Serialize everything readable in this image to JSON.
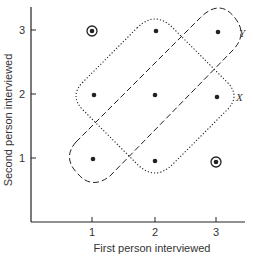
{
  "diagram": {
    "xlabel": "First person interviewed",
    "ylabel": "Second person interviewed",
    "x_ticks": [
      "1",
      "2",
      "3"
    ],
    "y_ticks": [
      "1",
      "2",
      "3"
    ],
    "regions": [
      {
        "name": "X",
        "style": "dotted",
        "label": "X",
        "points": [
          [
            1,
            2
          ],
          [
            2,
            3
          ],
          [
            2,
            2
          ],
          [
            3,
            2
          ],
          [
            2,
            1
          ]
        ]
      },
      {
        "name": "Y",
        "style": "dashed",
        "label": "Y",
        "points": [
          [
            1,
            1
          ],
          [
            2,
            2
          ],
          [
            3,
            3
          ]
        ]
      }
    ],
    "points": [
      {
        "x": 1,
        "y": 3,
        "circled": true
      },
      {
        "x": 2,
        "y": 3,
        "circled": false
      },
      {
        "x": 3,
        "y": 3,
        "circled": false
      },
      {
        "x": 1,
        "y": 2,
        "circled": false
      },
      {
        "x": 2,
        "y": 2,
        "circled": false
      },
      {
        "x": 3,
        "y": 2,
        "circled": false
      },
      {
        "x": 1,
        "y": 1,
        "circled": false
      },
      {
        "x": 2,
        "y": 1,
        "circled": false
      },
      {
        "x": 3,
        "y": 1,
        "circled": true
      }
    ],
    "colors": {
      "ink": "#222222",
      "background": "#ffffff"
    }
  }
}
